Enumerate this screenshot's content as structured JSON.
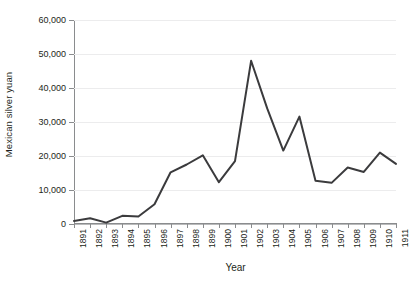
{
  "chart_data": {
    "type": "line",
    "title": "",
    "xlabel": "Year",
    "ylabel": "Mexican silver yuan",
    "categories": [
      "1891",
      "1892",
      "1893",
      "1894",
      "1895",
      "1896",
      "1897",
      "1898",
      "1899",
      "1900",
      "1901",
      "1902",
      "1903",
      "1904",
      "1905",
      "1906",
      "1907",
      "1908",
      "1909",
      "1910",
      "1911"
    ],
    "values": [
      900,
      1700,
      400,
      2400,
      2200,
      5800,
      15200,
      17500,
      20200,
      12300,
      18500,
      48000,
      34000,
      21600,
      31600,
      12700,
      12100,
      16600,
      15300,
      21000,
      17700
    ],
    "series": [
      {
        "name": "Mexican silver yuan",
        "values": [
          900,
          1700,
          400,
          2400,
          2200,
          5800,
          15200,
          17500,
          20200,
          12300,
          18500,
          48000,
          34000,
          21600,
          31600,
          12700,
          12100,
          16600,
          15300,
          21000,
          17700
        ]
      }
    ],
    "ylim": [
      0,
      60000
    ],
    "yticks": [
      0,
      10000,
      20000,
      30000,
      40000,
      50000,
      60000
    ],
    "ytick_labels": [
      "0",
      "10,000",
      "20,000",
      "30,000",
      "40,000",
      "50,000",
      "60,000"
    ],
    "xtick_labels": [
      "1891",
      "1892",
      "1893",
      "1894",
      "1895",
      "1896",
      "1897",
      "1898",
      "1899",
      "1900",
      "1901",
      "1902",
      "1903",
      "1904",
      "1905",
      "1906",
      "1907",
      "1908",
      "1909",
      "1910",
      "1911"
    ],
    "grid": true,
    "grid_axis": "y",
    "legend": false,
    "legend_position": "none",
    "line_color": "#3b3b3d",
    "grid_color": "#ececed",
    "axis_color": "#8a8c8e",
    "text_color": "#231f20",
    "background_color": "#ffffff",
    "line_width": 2
  }
}
